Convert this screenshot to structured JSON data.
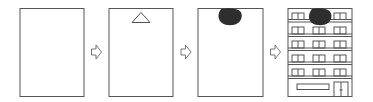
{
  "diagram": {
    "type": "process-sequence",
    "colors": {
      "stroke": "#555555",
      "blob": "#2e2e2e",
      "background": "#ffffff"
    },
    "steps": [
      {
        "id": "step-1",
        "content": "blank-panel"
      },
      {
        "id": "step-2",
        "content": "triangle-at-top"
      },
      {
        "id": "step-3",
        "content": "dark-blob-at-top"
      },
      {
        "id": "step-4",
        "content": "multi-story-building-with-dark-blob"
      }
    ],
    "arrows": [
      {
        "from": "step-1",
        "to": "step-2",
        "icon": "hollow-right-arrow-icon"
      },
      {
        "from": "step-2",
        "to": "step-3",
        "icon": "hollow-right-arrow-icon"
      },
      {
        "from": "step-3",
        "to": "step-4",
        "icon": "hollow-right-arrow-icon"
      }
    ],
    "building": {
      "floors_with_windows": 5,
      "window_groups_per_floor": 3,
      "panes_per_window_group": 2,
      "ground_floor": [
        "signboard",
        "door"
      ]
    }
  }
}
